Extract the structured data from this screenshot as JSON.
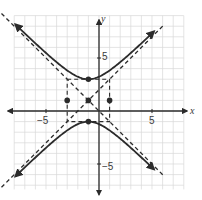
{
  "chart_data": {
    "type": "line",
    "title": "",
    "subtitle": "",
    "xlabel": "x",
    "ylabel": "y",
    "xlim": [
      -9,
      9
    ],
    "ylim": [
      -8,
      10
    ],
    "grid": true,
    "grid_step": 1,
    "x_tick_labels": [
      {
        "value": -5,
        "label": "−5"
      },
      {
        "value": 5,
        "label": "5"
      }
    ],
    "y_tick_labels": [
      {
        "value": 5,
        "label": "5"
      },
      {
        "value": -5,
        "label": "−5"
      }
    ],
    "legend": null,
    "hyperbola": {
      "equation": "(y−1)²/4 − (x+1)²/4 = 1",
      "orientation": "vertical",
      "center": [
        -1,
        1
      ],
      "a": 2,
      "b": 2,
      "vertices": [
        [
          -1,
          3
        ],
        [
          -1,
          -1
        ]
      ],
      "co_vertices": [
        [
          -3,
          1
        ],
        [
          1,
          1
        ]
      ]
    },
    "asymptotes": [
      {
        "equation": "y − 1 = x + 1",
        "slope": 1,
        "style": "dashed"
      },
      {
        "equation": "y − 1 = −(x + 1)",
        "slope": -1,
        "style": "dashed"
      }
    ],
    "central_rectangle": {
      "corners": [
        [
          -3,
          -1
        ],
        [
          1,
          -1
        ],
        [
          1,
          3
        ],
        [
          -3,
          3
        ]
      ],
      "style": "dashed"
    },
    "points": [
      {
        "label": "center",
        "x": -1,
        "y": 1
      },
      {
        "label": "vertex",
        "x": -1,
        "y": 3
      },
      {
        "label": "vertex",
        "x": -1,
        "y": -1
      },
      {
        "label": "co-vertex",
        "x": -3,
        "y": 1
      },
      {
        "label": "co-vertex",
        "x": 1,
        "y": 1
      }
    ],
    "colors": {
      "curve": "#2b2b2b",
      "axis": "#2b2b2b",
      "grid": "#d9d9d9",
      "dashed": "#2b2b2b"
    }
  },
  "labels": {
    "x_axis": "x",
    "y_axis": "y",
    "x_neg5": "−5",
    "x_pos5": "5",
    "y_pos5": "5",
    "y_neg5": "−5"
  }
}
